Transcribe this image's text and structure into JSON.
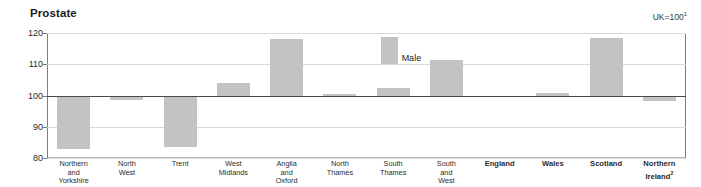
{
  "chart_data": {
    "type": "bar",
    "title": "Prostate",
    "subtitle": "",
    "note": "UK=100",
    "note_superscript": "1",
    "xlabel": "",
    "ylabel": "",
    "ylim": [
      80,
      120
    ],
    "yticks": [
      80,
      90,
      100,
      110,
      120
    ],
    "ytick_labels": [
      "80",
      "90",
      "100",
      "110",
      "120"
    ],
    "baseline": 100,
    "grid": true,
    "legend": {
      "position": "inside-plot",
      "entries": [
        "Male"
      ]
    },
    "series": [
      {
        "name": "Male",
        "color": "#c3c3c3",
        "values": [
          83.0,
          98.6,
          83.5,
          104.0,
          118.2,
          100.4,
          102.5,
          111.5,
          100.0,
          100.8,
          118.4,
          98.2
        ]
      }
    ],
    "categories": [
      "Northern\nand\nYorkshire",
      "North\nWest",
      "Trent",
      "West\nMidlands",
      "Anglia\nand\nOxford",
      "North\nThames",
      "South\nThames",
      "South\nand\nWest",
      "England",
      "Wales",
      "Scotland",
      "Northern\nIreland"
    ],
    "category_bold": [
      false,
      false,
      false,
      false,
      false,
      false,
      false,
      false,
      true,
      true,
      true,
      true
    ],
    "category_superscripts": [
      "",
      "",
      "",
      "",
      "",
      "",
      "",
      "",
      "",
      "",
      "",
      "2"
    ],
    "annotations": [
      {
        "text": "Male",
        "x_category": "South Thames",
        "value": 118.6
      }
    ]
  },
  "icons": {}
}
